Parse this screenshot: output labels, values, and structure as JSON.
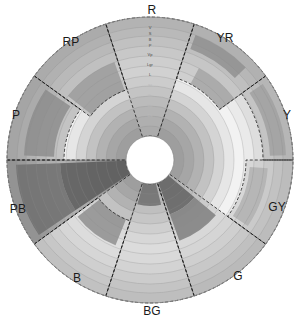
{
  "figure": {
    "kind": "polar-tone-hue-diagram",
    "center": {
      "x": 150,
      "y": 160
    },
    "inner_radius": 24,
    "outer_radius": 143,
    "background": "#ffffff"
  },
  "hue_labels": [
    {
      "name": "R",
      "x": 152,
      "y": 10,
      "angle_deg": 90
    },
    {
      "name": "YR",
      "x": 225,
      "y": 38,
      "angle_deg": 54
    },
    {
      "name": "Y",
      "x": 287,
      "y": 115,
      "angle_deg": 18
    },
    {
      "name": "GY",
      "x": 277,
      "y": 207,
      "angle_deg": -18
    },
    {
      "name": "G",
      "x": 238,
      "y": 276,
      "angle_deg": -54
    },
    {
      "name": "BG",
      "x": 152,
      "y": 311,
      "angle_deg": -90
    },
    {
      "name": "B",
      "x": 77,
      "y": 278,
      "angle_deg": -126
    },
    {
      "name": "PB",
      "x": 18,
      "y": 209,
      "angle_deg": -162
    },
    {
      "name": "P",
      "x": 16,
      "y": 115,
      "angle_deg": 162
    },
    {
      "name": "RP",
      "x": 71,
      "y": 42,
      "angle_deg": 126
    }
  ],
  "tone_labels": [
    {
      "name": "V",
      "radius": 132,
      "faint": false
    },
    {
      "name": "S",
      "radius": 126,
      "faint": false
    },
    {
      "name": "B",
      "radius": 120,
      "faint": false
    },
    {
      "name": "P",
      "radius": 114,
      "faint": false
    },
    {
      "name": "Vp",
      "radius": 105,
      "faint": false
    },
    {
      "name": "Lgr",
      "radius": 95,
      "faint": false
    },
    {
      "name": "L",
      "radius": 85,
      "faint": false
    },
    {
      "name": "Sf",
      "radius": 74,
      "faint": true
    },
    {
      "name": "Gr",
      "radius": 64,
      "faint": true
    },
    {
      "name": "Dp",
      "radius": 54,
      "faint": true
    },
    {
      "name": "Dk",
      "radius": 44,
      "faint": true
    }
  ],
  "rings": {
    "count": 12,
    "radii": [
      24,
      34,
      44,
      54,
      64,
      74,
      84,
      94,
      104,
      114,
      124,
      133,
      143
    ],
    "grid_color": "#8a8a8a",
    "grid_opacity": 0.55
  },
  "chart_data": {
    "type": "bar",
    "subtype": "polar-stacked-radial-bars",
    "title": "",
    "xlabel": "",
    "ylabel": "",
    "grid": true,
    "legend": "none",
    "angular_categories": [
      "R",
      "YR",
      "Y",
      "GY",
      "G",
      "BG",
      "B",
      "PB",
      "P",
      "RP"
    ],
    "radial_categories": [
      "V",
      "S",
      "B",
      "P",
      "Vp",
      "Lgr",
      "L",
      "Sf",
      "Gr",
      "Dp",
      "Dk"
    ],
    "rlim": [
      0,
      143
    ],
    "sectors": [
      {
        "hue": "R",
        "start_deg": 72,
        "end_deg": 108,
        "inner": 24,
        "outer": 143,
        "fill": "#b6b6b6"
      },
      {
        "hue": "YR",
        "start_deg": 36,
        "end_deg": 72,
        "inner": 86,
        "outer": 143,
        "fill": "#b2b2b2"
      },
      {
        "hue": "Y",
        "start_deg": 0,
        "end_deg": 36,
        "inner": 113,
        "outer": 143,
        "fill": "#bcbcbc"
      },
      {
        "hue": "GY",
        "start_deg": -36,
        "end_deg": 0,
        "inner": 96,
        "outer": 143,
        "fill": "#c6c6c6"
      },
      {
        "hue": "G",
        "start_deg": -72,
        "end_deg": -36,
        "inner": 24,
        "outer": 143,
        "fill": "#c2c2c2"
      },
      {
        "hue": "BG",
        "start_deg": -108,
        "end_deg": -72,
        "inner": 24,
        "outer": 143,
        "fill": "#cacaca"
      },
      {
        "hue": "B",
        "start_deg": -144,
        "end_deg": -108,
        "inner": 64,
        "outer": 143,
        "fill": "#cfcfcf"
      },
      {
        "hue": "PB",
        "start_deg": 180,
        "end_deg": -144,
        "inner": 24,
        "outer": 143,
        "fill": "#7c7c7c"
      },
      {
        "hue": "P",
        "start_deg": 144,
        "end_deg": 180,
        "inner": 86,
        "outer": 143,
        "fill": "#9c9c9c"
      },
      {
        "hue": "RP",
        "start_deg": 108,
        "end_deg": 144,
        "inner": 74,
        "outer": 143,
        "fill": "#a8a8a8"
      }
    ],
    "ring_bands": [
      {
        "index": 0,
        "r0": 133,
        "r1": 143,
        "shade": "#b0b0b0"
      },
      {
        "index": 1,
        "r0": 124,
        "r1": 133,
        "shade": "#bdbdbd"
      },
      {
        "index": 2,
        "r0": 114,
        "r1": 124,
        "shade": "#cfcfcf"
      },
      {
        "index": 3,
        "r0": 104,
        "r1": 114,
        "shade": "#dedede"
      },
      {
        "index": 4,
        "r0": 94,
        "r1": 104,
        "shade": "#eaeaea"
      },
      {
        "index": 5,
        "r0": 84,
        "r1": 94,
        "shade": "#f2f2f2"
      },
      {
        "index": 6,
        "r0": 74,
        "r1": 84,
        "shade": "#e6e6e6"
      },
      {
        "index": 7,
        "r0": 64,
        "r1": 74,
        "shade": "#d4d4d4"
      },
      {
        "index": 8,
        "r0": 54,
        "r1": 64,
        "shade": "#c2c2c2"
      },
      {
        "index": 9,
        "r0": 44,
        "r1": 54,
        "shade": "#b2b2b2"
      },
      {
        "index": 10,
        "r0": 34,
        "r1": 44,
        "shade": "#a6a6a6"
      },
      {
        "index": 11,
        "r0": 24,
        "r1": 34,
        "shade": "#9e9e9e"
      }
    ],
    "highlight_patches": [
      {
        "hue": "YR",
        "start_deg": 44,
        "end_deg": 70,
        "r0": 118,
        "r1": 133,
        "shade": "#8f8f8f"
      },
      {
        "hue": "YR",
        "start_deg": 36,
        "end_deg": 62,
        "r0": 86,
        "r1": 104,
        "shade": "#a3a3a3"
      },
      {
        "hue": "Y",
        "start_deg": 2,
        "end_deg": 34,
        "r0": 120,
        "r1": 136,
        "shade": "#a0a0a0"
      },
      {
        "hue": "GY",
        "start_deg": -34,
        "end_deg": -4,
        "r0": 100,
        "r1": 118,
        "shade": "#b0b0b0"
      },
      {
        "hue": "G",
        "start_deg": -70,
        "end_deg": -40,
        "r0": 24,
        "r1": 58,
        "shade": "#5e5e5e"
      },
      {
        "hue": "G",
        "start_deg": -70,
        "end_deg": -40,
        "r0": 58,
        "r1": 86,
        "shade": "#7d7d7d"
      },
      {
        "hue": "BG",
        "start_deg": -106,
        "end_deg": -76,
        "r0": 24,
        "r1": 46,
        "shade": "#6a6a6a"
      },
      {
        "hue": "B",
        "start_deg": -142,
        "end_deg": -112,
        "r0": 64,
        "r1": 92,
        "shade": "#8c8c8c"
      },
      {
        "hue": "PB",
        "start_deg": 182,
        "end_deg": 214,
        "r0": 90,
        "r1": 134,
        "shade": "#6d6d6d"
      },
      {
        "hue": "PB",
        "start_deg": 182,
        "end_deg": 214,
        "r0": 24,
        "r1": 90,
        "shade": "#585858"
      },
      {
        "hue": "P",
        "start_deg": 146,
        "end_deg": 178,
        "r0": 96,
        "r1": 126,
        "shade": "#8b8b8b"
      },
      {
        "hue": "RP",
        "start_deg": 110,
        "end_deg": 142,
        "r0": 74,
        "r1": 104,
        "shade": "#9a9a9a"
      }
    ],
    "dashed_outline": {
      "present": true,
      "color": "#1a1a1a",
      "dash": "3 2",
      "description": "dashed boundary tracing the outer envelope of the plotted tone regions"
    }
  }
}
